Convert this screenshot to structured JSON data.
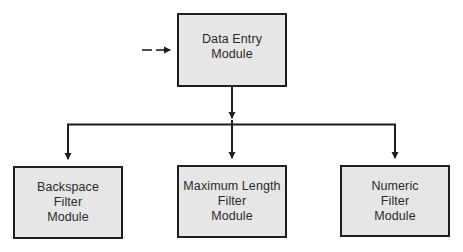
{
  "diagram": {
    "type": "hierarchy",
    "colors": {
      "box_fill": "#e6e6e6",
      "box_border": "#1e1e1e",
      "line": "#1e1e1e",
      "text": "#2a2a2a"
    },
    "root": {
      "id": "data-entry-module",
      "lines": [
        "Data Entry",
        "Module"
      ],
      "incoming": "dashed-arrow"
    },
    "children": [
      {
        "id": "backspace-filter-module",
        "lines": [
          "Backspace",
          "Filter",
          "Module"
        ]
      },
      {
        "id": "maximum-length-filter-module",
        "lines": [
          "Maximum Length",
          "Filter",
          "Module"
        ]
      },
      {
        "id": "numeric-filter-module",
        "lines": [
          "Numeric",
          "Filter",
          "Module"
        ]
      }
    ],
    "edges": [
      {
        "from": "external",
        "to": "data-entry-module",
        "style": "dashed"
      },
      {
        "from": "data-entry-module",
        "to": "backspace-filter-module",
        "style": "solid"
      },
      {
        "from": "data-entry-module",
        "to": "maximum-length-filter-module",
        "style": "solid"
      },
      {
        "from": "data-entry-module",
        "to": "numeric-filter-module",
        "style": "solid"
      }
    ]
  }
}
